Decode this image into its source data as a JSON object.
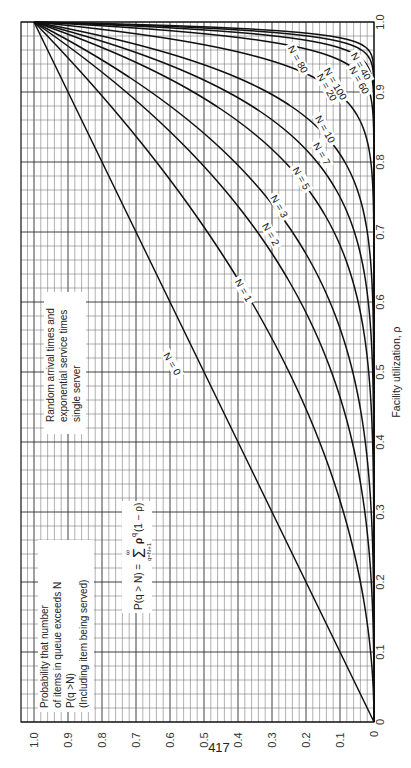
{
  "page": {
    "number": "417"
  },
  "chart_data": {
    "type": "line",
    "orientation": "rotated-90-ccw",
    "title": "Probability that number of items in queue exceeds N",
    "xlabel": "Facility utilization, ρ",
    "ylabel": "P(q > N)",
    "xlim": [
      0,
      1.0
    ],
    "ylim": [
      0,
      1.0
    ],
    "grid": true,
    "x_ticks": [
      "0",
      "0.1",
      "0.2",
      "0.3",
      "0.4",
      "0.5",
      "0.6",
      "0.7",
      "0.8",
      "0.9",
      "1.0"
    ],
    "y_ticks": [
      "0",
      "0.1",
      "0.2",
      "0.3",
      "0.4",
      "0.5",
      "0.6",
      "0.7",
      "0.8",
      "0.9",
      "1.0"
    ],
    "formula": "P(q > N) = Σ_{q=N+1}^{∞} ρ^q (1 − ρ) = ρ^(N+1)",
    "annotations": {
      "description_lines": [
        "Probability that number",
        "of items in queue exceeds N",
        "P(q >N)",
        "(Including item being served)"
      ],
      "formula_text": {
        "lhs": "P(q > N) =",
        "sum": "Σ",
        "upper": "∞",
        "lower": "q=N+1",
        "rhs": "ρ",
        "exp": "q",
        "tail": "(1 − ρ)"
      },
      "assumption_lines": [
        "Random arrival times and",
        "exponential service times",
        "single server"
      ]
    },
    "series": [
      {
        "name": "N = 0",
        "N": 0,
        "label": "N = 0",
        "x": [
          0,
          0.1,
          0.2,
          0.3,
          0.4,
          0.5,
          0.6,
          0.7,
          0.8,
          0.9,
          1.0
        ],
        "values": [
          0,
          0.1,
          0.2,
          0.3,
          0.4,
          0.5,
          0.6,
          0.7,
          0.8,
          0.9,
          1.0
        ]
      },
      {
        "name": "N = 1",
        "N": 1,
        "label": "N = 1",
        "x": [
          0,
          0.1,
          0.2,
          0.3,
          0.4,
          0.5,
          0.6,
          0.7,
          0.8,
          0.9,
          1.0
        ],
        "values": [
          0,
          0.01,
          0.04,
          0.09,
          0.16,
          0.25,
          0.36,
          0.49,
          0.64,
          0.81,
          1.0
        ]
      },
      {
        "name": "N = 2",
        "N": 2,
        "label": "N = 2",
        "x": [
          0,
          0.1,
          0.2,
          0.3,
          0.4,
          0.5,
          0.6,
          0.7,
          0.8,
          0.9,
          1.0
        ],
        "values": [
          0,
          0.001,
          0.008,
          0.027,
          0.064,
          0.125,
          0.216,
          0.343,
          0.512,
          0.729,
          1.0
        ]
      },
      {
        "name": "N = 3",
        "N": 3,
        "label": "N = 3",
        "x": [
          0,
          0.1,
          0.2,
          0.3,
          0.4,
          0.5,
          0.6,
          0.7,
          0.8,
          0.9,
          1.0
        ],
        "values": [
          0,
          0.0001,
          0.0016,
          0.0081,
          0.0256,
          0.0625,
          0.1296,
          0.2401,
          0.4096,
          0.6561,
          1.0
        ]
      },
      {
        "name": "N = 5",
        "N": 5,
        "label": "N = 5",
        "x": [
          0,
          0.1,
          0.2,
          0.3,
          0.4,
          0.5,
          0.6,
          0.7,
          0.8,
          0.9,
          1.0
        ],
        "values": [
          0,
          0,
          0.0001,
          0.0007,
          0.0041,
          0.0156,
          0.0467,
          0.1176,
          0.2621,
          0.5314,
          1.0
        ]
      },
      {
        "name": "N = 7",
        "N": 7,
        "label": "N = 7",
        "x": [
          0,
          0.1,
          0.2,
          0.3,
          0.4,
          0.5,
          0.6,
          0.7,
          0.8,
          0.9,
          1.0
        ],
        "values": [
          0,
          0,
          0,
          0.0001,
          0.0007,
          0.0039,
          0.0168,
          0.0576,
          0.1678,
          0.4305,
          1.0
        ]
      },
      {
        "name": "N = 10",
        "N": 10,
        "label": "N = 10",
        "x": [
          0,
          0.1,
          0.2,
          0.3,
          0.4,
          0.5,
          0.6,
          0.7,
          0.8,
          0.9,
          1.0
        ],
        "values": [
          0,
          0,
          0,
          0,
          0,
          0.0005,
          0.0036,
          0.0198,
          0.0859,
          0.3138,
          1.0
        ]
      },
      {
        "name": "N = 20",
        "N": 20,
        "label": "N = 20",
        "x": [
          0,
          0.1,
          0.2,
          0.3,
          0.4,
          0.5,
          0.6,
          0.7,
          0.8,
          0.9,
          1.0
        ],
        "values": [
          0,
          0,
          0,
          0,
          0,
          0,
          0,
          0.0006,
          0.0092,
          0.1094,
          1.0
        ]
      },
      {
        "name": "N = 40",
        "N": 40,
        "label": "N = 40",
        "x": [
          0,
          0.1,
          0.2,
          0.3,
          0.4,
          0.5,
          0.6,
          0.7,
          0.8,
          0.9,
          1.0
        ],
        "values": [
          0,
          0,
          0,
          0,
          0,
          0,
          0,
          0,
          0.0001,
          0.0133,
          1.0
        ]
      },
      {
        "name": "N = 60",
        "N": 60,
        "label": "N = 60",
        "x": [
          0,
          0.1,
          0.2,
          0.3,
          0.4,
          0.5,
          0.6,
          0.7,
          0.8,
          0.9,
          1.0
        ],
        "values": [
          0,
          0,
          0,
          0,
          0,
          0,
          0,
          0,
          0,
          0.0016,
          1.0
        ]
      },
      {
        "name": "N = 80",
        "N": 80,
        "label": "N = 80",
        "x": [
          0,
          0.1,
          0.2,
          0.3,
          0.4,
          0.5,
          0.6,
          0.7,
          0.8,
          0.9,
          1.0
        ],
        "values": [
          0,
          0,
          0,
          0,
          0,
          0,
          0,
          0,
          0,
          0.0002,
          1.0
        ]
      },
      {
        "name": "N = 100",
        "N": 100,
        "label": "N = 100",
        "x": [
          0,
          0.1,
          0.2,
          0.3,
          0.4,
          0.5,
          0.6,
          0.7,
          0.8,
          0.9,
          1.0
        ],
        "values": [
          0,
          0,
          0,
          0,
          0,
          0,
          0,
          0,
          0,
          0,
          1.0
        ]
      }
    ],
    "label_positions": [
      {
        "N": 0,
        "rho": 0.51,
        "p": 0.6
      },
      {
        "N": 1,
        "rho": 0.615,
        "p": 0.39
      },
      {
        "N": 2,
        "rho": 0.695,
        "p": 0.31
      },
      {
        "N": 3,
        "rho": 0.735,
        "p": 0.285
      },
      {
        "N": 5,
        "rho": 0.775,
        "p": 0.22
      },
      {
        "N": 7,
        "rho": 0.81,
        "p": 0.16
      },
      {
        "N": 10,
        "rho": 0.845,
        "p": 0.15
      },
      {
        "N": 20,
        "rho": 0.905,
        "p": 0.145
      },
      {
        "N": 40,
        "rho": 0.935,
        "p": 0.045
      },
      {
        "N": 60,
        "rho": 0.915,
        "p": 0.05
      },
      {
        "N": 80,
        "rho": 0.945,
        "p": 0.23
      },
      {
        "N": 100,
        "rho": 0.91,
        "p": 0.12
      }
    ]
  }
}
